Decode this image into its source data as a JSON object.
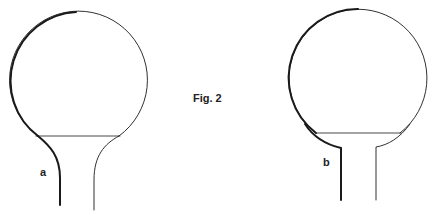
{
  "figure": {
    "caption": "Fig. 2",
    "panels": [
      {
        "label": "a",
        "description": "Round-bottom flask with smoothly tapering (curved) neck; thick left outline"
      },
      {
        "label": "b",
        "description": "Round-bottom flask with abrupt shoulder into straight neck; thick left outline"
      }
    ]
  },
  "colors": {
    "stroke": "#1a1a1a",
    "background": "#ffffff"
  }
}
